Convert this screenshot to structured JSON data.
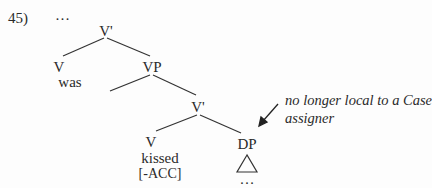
{
  "example": {
    "number": "45)",
    "top_ellipsis": "…"
  },
  "tree": {
    "root": "V'",
    "left_v": {
      "label": "V",
      "word": "was"
    },
    "vp": "VP",
    "inner_vbar": "V'",
    "inner_v": {
      "label": "V",
      "word": "kissed",
      "feature": "[-ACC]"
    },
    "dp": {
      "label": "DP",
      "content": "…"
    }
  },
  "annotation": {
    "line1": "no longer local to a Case",
    "line2": "assigner"
  }
}
